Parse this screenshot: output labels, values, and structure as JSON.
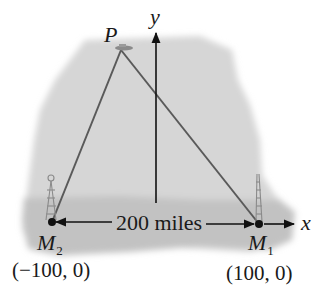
{
  "diagram": {
    "type": "coordinate-geometry-illustration",
    "colors": {
      "background": "#ffffff",
      "shading": "#d4d4d4",
      "ground": "#c4c4c4",
      "lines": "#5a5a5a",
      "axes": "#111111",
      "text": "#1a1a1a"
    },
    "axes": {
      "x_label": "x",
      "y_label": "y"
    },
    "points": {
      "P": {
        "label": "P"
      },
      "M1": {
        "label": "M",
        "subscript": "1",
        "coord": "(100, 0)"
      },
      "M2": {
        "label": "M",
        "subscript": "2",
        "coord": "(−100, 0)"
      }
    },
    "distance_label": "200 miles"
  }
}
